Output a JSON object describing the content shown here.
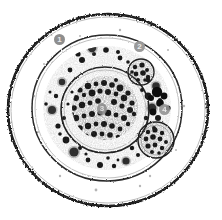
{
  "figure": {
    "background_color": "#ffffff",
    "width": 222,
    "height": 220,
    "ink_color": "#1a1a1a",
    "badge_color": "#8e8e8e",
    "badge_text_color": "#e8e8e8"
  },
  "annotations": [
    {
      "id": "1",
      "label": "1",
      "target": "outer-capsule-region",
      "x": 54,
      "y": 34
    },
    {
      "id": "2",
      "label": "2",
      "target": "vesicle-upper-right",
      "x": 134,
      "y": 41
    },
    {
      "id": "3",
      "label": "3",
      "target": "nucleus-chromatin-core",
      "x": 97,
      "y": 103
    },
    {
      "id": "4",
      "label": "4",
      "target": "granule-cluster-right",
      "x": 159,
      "y": 104
    }
  ],
  "structures": {
    "outer_membrane": {
      "name": "outer-membrane",
      "cx": 108,
      "cy": 110,
      "rx": 101,
      "ry": 97
    },
    "inner_membrane": {
      "name": "inner-membrane",
      "cx": 107,
      "cy": 108,
      "rx": 76,
      "ry": 74
    },
    "cytoplasm": {
      "name": "cytoplasm",
      "cx": 107,
      "cy": 108,
      "rx": 66,
      "ry": 64
    },
    "nucleus": {
      "name": "nucleus",
      "cx": 105,
      "cy": 110,
      "rx": 45,
      "ry": 44
    },
    "chromatin_core": {
      "name": "chromatin-core",
      "cx": 105,
      "cy": 108,
      "rx": 33,
      "ry": 32
    },
    "vesicle_upper_right": {
      "name": "vesicle-upper-right",
      "cx": 141,
      "cy": 72,
      "r": 14
    },
    "vesicle_lower_right": {
      "name": "vesicle-lower-right",
      "cx": 156,
      "cy": 140,
      "r": 19
    }
  }
}
